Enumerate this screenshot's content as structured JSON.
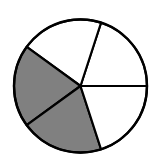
{
  "diagram": {
    "type": "fraction-circle",
    "total_parts": 5,
    "shaded_parts": 2,
    "fraction": "2/5",
    "colors": {
      "shaded": "#808080",
      "unshaded": "#ffffff",
      "stroke": "#000000"
    }
  },
  "chart_data": {
    "type": "pie",
    "categories": [
      "Shaded",
      "Shaded",
      "Unshaded",
      "Unshaded",
      "Unshaded"
    ],
    "values": [
      1,
      1,
      1,
      1,
      1
    ],
    "title": ""
  }
}
